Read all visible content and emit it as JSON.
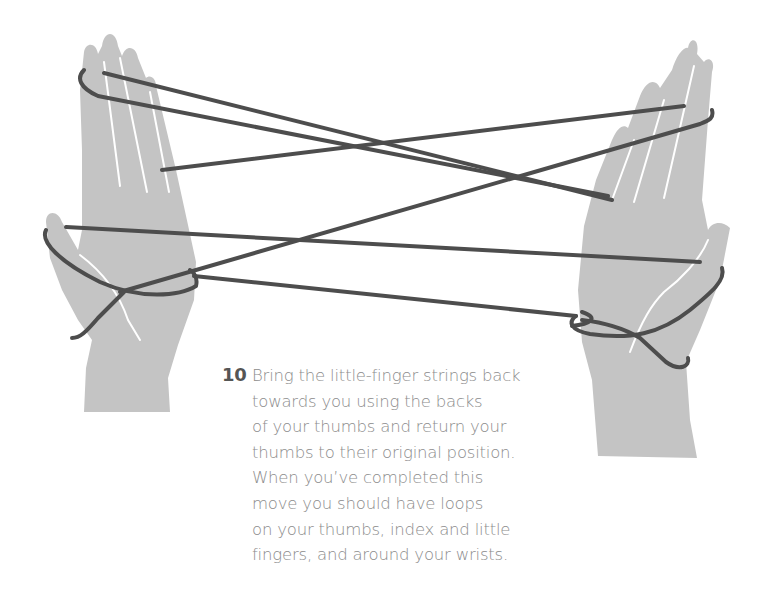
{
  "step": {
    "number": "10",
    "lines": [
      "Bring the little-finger strings back",
      "towards you using the backs",
      "of your thumbs and return your",
      "thumbs to their original position.",
      "When you’ve completed this",
      "move you should have loops",
      "on your thumbs, index and little",
      "fingers, and around your wrists."
    ]
  },
  "illustration": {
    "subject": "two-hands-cats-cradle-string-figure",
    "hand_color": "#c4c4c4",
    "string_color": "#4d4d4d",
    "crease_color": "#ffffff"
  }
}
